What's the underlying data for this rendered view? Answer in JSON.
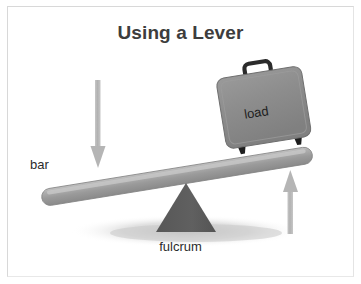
{
  "figure": {
    "title": "Using a Lever",
    "background_color": "#ffffff",
    "border_color": "#d8d8d8",
    "width": 361,
    "height": 284
  },
  "labels": {
    "bar": "bar",
    "fulcrum": "fulcrum",
    "load": "load"
  },
  "parts": {
    "bar": {
      "name": "lever-bar",
      "color": "#9b9b9b",
      "highlight_color": "#bdbdbd",
      "shade_color": "#868686"
    },
    "fulcrum": {
      "name": "fulcrum-triangle",
      "color": "#5e5e5e"
    },
    "load": {
      "name": "suitcase-load",
      "body_color": "#8e8e8e",
      "edge_color": "#777777",
      "handle_color": "#2e2e2e",
      "foot_color": "#1c1c1c"
    },
    "effort_arrow": {
      "name": "down-arrow-effort",
      "color": "#b7b7b7",
      "direction": "down"
    },
    "reaction_arrow": {
      "name": "up-arrow-reaction",
      "color": "#b7b7b7",
      "direction": "up"
    },
    "ground_shadow": {
      "name": "ground-shadow",
      "color": "#cfcfcf"
    }
  }
}
